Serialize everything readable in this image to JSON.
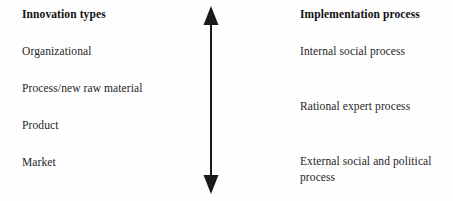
{
  "diagram": {
    "background_color": "#fefefe",
    "text_color": "#1f1f1f",
    "left_column": {
      "heading": "Innovation types",
      "items": [
        "Organizational",
        "Process/new raw material",
        "Product",
        "Market"
      ]
    },
    "right_column": {
      "heading": "Implementation process",
      "items": [
        "Internal social process",
        "Rational expert process",
        "External social and political process"
      ]
    },
    "connector": {
      "icon": "double-headed-vertical-arrow-icon",
      "color": "#1a1a1a",
      "orientation": "vertical",
      "heads": "both"
    }
  }
}
